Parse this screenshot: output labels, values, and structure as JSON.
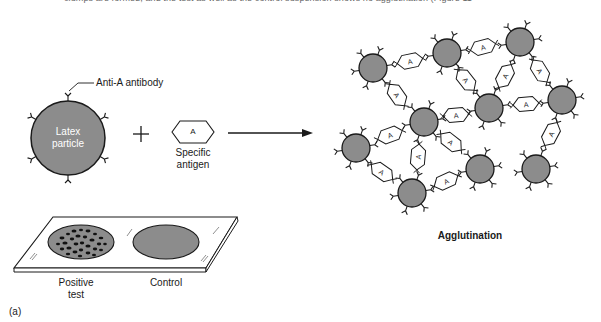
{
  "caption_top": "clumps are formed, and the test as well as the control suspension shows no agglutination (Figure 11-",
  "left_panel": {
    "antibody_label": "Anti-A antibody",
    "particle_label_line1": "Latex",
    "particle_label_line2": "particle",
    "plus_symbol": "+",
    "antigen_symbol": "A",
    "antigen_label_line1": "Specific",
    "antigen_label_line2": "antigen"
  },
  "slide": {
    "positive_label_line1": "Positive",
    "positive_label_line2": "test",
    "control_label": "Control"
  },
  "right_panel": {
    "title": "Agglutination",
    "antigen_symbol": "A"
  },
  "panel_label": "(a)",
  "colors": {
    "particle_fill": "#8c8c8c",
    "stroke": "#1a1a1a",
    "background": "#ffffff"
  }
}
